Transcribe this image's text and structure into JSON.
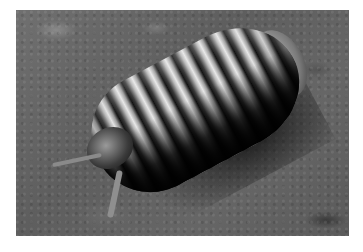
{
  "image": {
    "subject": "pill millipede",
    "description": "Glossy segmented pill millipede crawling on dark soil",
    "style": "grayscale photograph",
    "colors": {
      "background": "#ffffff",
      "soil": "#666666",
      "highlight": "#e8e8e8",
      "shadow": "#111111"
    }
  }
}
